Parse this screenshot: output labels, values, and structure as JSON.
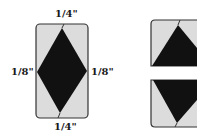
{
  "diagram": {
    "left_template": {
      "labels": {
        "top": "1/4\"",
        "left": "1/8\"",
        "right": "1/8\"",
        "bottom": "1/4\""
      }
    },
    "right_pieces": {
      "count": 2,
      "top_piece": "upward-triangle",
      "bottom_piece": "downward-triangle"
    },
    "colors": {
      "background_fill": "#dcdcdc",
      "diamond_fill": "#111111",
      "outline": "#333333"
    }
  }
}
